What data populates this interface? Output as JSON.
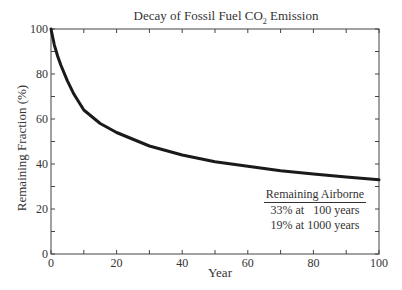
{
  "chart_data": {
    "type": "line",
    "title": "Decay of Fossil Fuel CO2 Emission",
    "xlabel": "Year",
    "ylabel": "Remaining Fraction (%)",
    "xlim": [
      0,
      100
    ],
    "ylim": [
      0,
      100
    ],
    "xticks": [
      0,
      20,
      40,
      60,
      80,
      100
    ],
    "yticks": [
      0,
      20,
      40,
      60,
      80,
      100
    ],
    "grid": false,
    "series": [
      {
        "name": "Remaining fraction",
        "x": [
          0,
          1,
          2,
          3,
          5,
          7,
          10,
          15,
          20,
          30,
          40,
          50,
          60,
          70,
          80,
          90,
          100
        ],
        "y": [
          100,
          93,
          88,
          84,
          77,
          71,
          64,
          58,
          54,
          48,
          44,
          41,
          39,
          37,
          35.5,
          34.2,
          33
        ]
      }
    ],
    "annotation": {
      "heading": "Remaining Airborne",
      "lines": [
        "33% at   100 years",
        "19% at 1000 years"
      ]
    }
  },
  "title_main": "Decay of Fossil Fuel CO",
  "title_sub": "2",
  "title_tail": " Emission",
  "xlabel": "Year",
  "ylabel": "Remaining Fraction (%)",
  "legend": {
    "heading": "Remaining Airborne",
    "line1": "33% at   100 years",
    "line2": "19% at 1000 years"
  }
}
